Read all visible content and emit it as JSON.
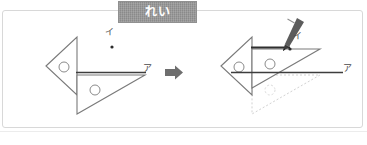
{
  "banner": {
    "label": "れい",
    "bg_color": "#8a8a8a",
    "text_color": "#ffffff"
  },
  "frame": {
    "border_color": "#d8d8d8",
    "background": "#ffffff"
  },
  "colors": {
    "ink": "#5a5a5a",
    "ink_dark": "#3d3d3d",
    "ruler_stroke": "#777777",
    "ghost": "#d6d6d6",
    "arrow": "#6e6e6e",
    "pencil_body": "#5c5c5c",
    "pencil_tip": "#3a3a3a",
    "point": "#2b2b2b"
  },
  "transition_arrow": {
    "icon": "right-arrow-icon",
    "direction": "right"
  },
  "panels": [
    {
      "id": "before",
      "name": "before-panel",
      "caption": "",
      "labels": [
        {
          "id": "i-label",
          "text": "イ",
          "x": 104,
          "y": 23
        },
        {
          "id": "a-label",
          "text": "ア",
          "x": 143,
          "y": 57
        }
      ],
      "point": {
        "id": "point-i",
        "x": 110,
        "y": 37
      },
      "shapes": {
        "fixed_triangle": {
          "name": "fixed-set-square",
          "points": "44,56 75,27 75,85",
          "hole": {
            "cx": 62,
            "cy": 57,
            "r": 5
          }
        },
        "moving_triangle": {
          "name": "moving-set-square",
          "points": "75,64 143,64 75,104",
          "hole": {
            "cx": 93,
            "cy": 79,
            "r": 5
          }
        },
        "ruler_line": {
          "x1": 75,
          "y1": 63,
          "x2": 143,
          "y2": 63
        }
      }
    },
    {
      "id": "after",
      "name": "after-panel",
      "caption": "",
      "labels": [
        {
          "id": "i-label",
          "text": "イ",
          "x": 291,
          "y": 27
        },
        {
          "id": "a-label",
          "text": "ア",
          "x": 342,
          "y": 57
        }
      ],
      "point": {
        "id": "point-i",
        "x": 287,
        "y": 38
      },
      "shapes": {
        "fixed_triangle": {
          "name": "fixed-set-square",
          "points": "219,56 250,27 250,85",
          "hole": {
            "cx": 237,
            "cy": 57,
            "r": 5
          }
        },
        "moving_triangle": {
          "name": "moving-set-square",
          "points": "250,38 318,38 250,78",
          "hole": {
            "cx": 268,
            "cy": 53,
            "r": 5
          }
        },
        "ghost_triangle": {
          "name": "ghost-set-square",
          "points": "250,64 318,64 250,104",
          "hole": {
            "cx": 268,
            "cy": 79,
            "r": 5
          }
        },
        "drawn_line": {
          "x1": 250,
          "y1": 37,
          "x2": 290,
          "y2": 37
        },
        "ruler_line": {
          "x1": 230,
          "y1": 63,
          "x2": 340,
          "y2": 63
        }
      },
      "pencil": {
        "name": "pencil-icon",
        "tip_x": 285,
        "tip_y": 40
      }
    }
  ]
}
